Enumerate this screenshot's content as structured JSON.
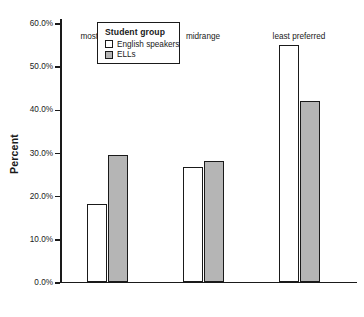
{
  "chart_data": {
    "type": "bar",
    "title": "",
    "xlabel": "",
    "ylabel": "Percent",
    "categories": [
      "most preferred",
      "midrange",
      "least preferred"
    ],
    "series": [
      {
        "name": "English speakers",
        "color": "#ffffff",
        "values": [
          17.9,
          26.5,
          54.8
        ]
      },
      {
        "name": "ELLs",
        "color": "#b5b5b5",
        "values": [
          29.3,
          28.0,
          41.9
        ]
      }
    ],
    "ylim": [
      0,
      60
    ],
    "yticks": [
      0,
      10,
      20,
      30,
      40,
      50,
      60
    ],
    "ytick_labels": [
      "0.0%",
      "10.0%",
      "20.0%",
      "30.0%",
      "40.0%",
      "50.0%",
      "60.0%"
    ],
    "grid": false,
    "legend": {
      "position": "top-left",
      "title": "Student group",
      "entries": [
        {
          "label": "English speakers",
          "swatch": "light"
        },
        {
          "label": "ELLs",
          "swatch": "dark"
        }
      ]
    }
  },
  "colors": {
    "axis": "#1a1a1a",
    "bar_light": "#ffffff",
    "bar_dark": "#b5b5b5",
    "background": "#ffffff"
  }
}
